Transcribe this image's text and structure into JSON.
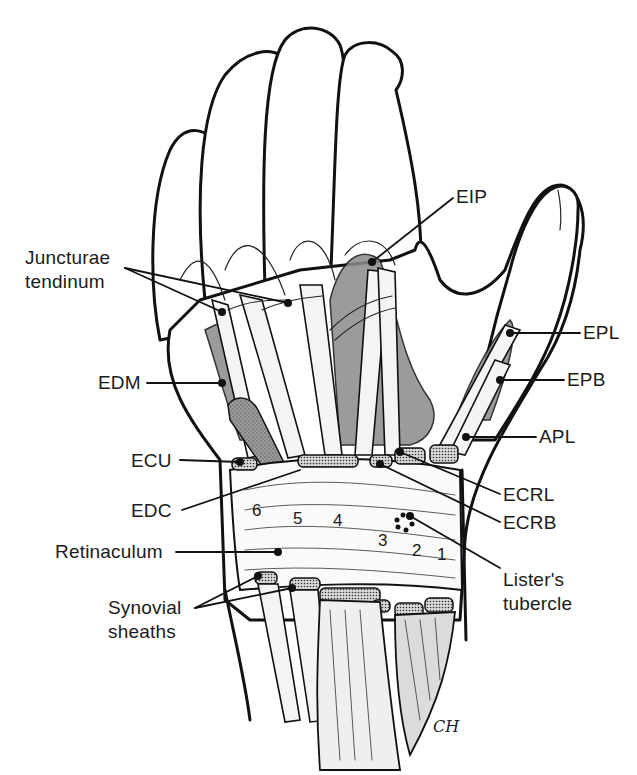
{
  "figure": {
    "signature": "CH"
  },
  "labels": {
    "junctura": "Juncturae\ntendinum",
    "eip": "EIP",
    "epl": "EPL",
    "epb": "EPB",
    "apl": "APL",
    "edm": "EDM",
    "ecu": "ECU",
    "edc": "EDC",
    "ecrl": "ECRL",
    "ecrb": "ECRB",
    "retinaculum": "Retinaculum",
    "listers": "Lister's\ntubercle",
    "synovial": "Synovial\nsheaths"
  },
  "compartments": {
    "c1": "1",
    "c2": "2",
    "c3": "3",
    "c4": "4",
    "c5": "5",
    "c6": "6"
  },
  "colors": {
    "ink": "#111111",
    "shade": "#8a8a8a",
    "background": "#ffffff"
  }
}
